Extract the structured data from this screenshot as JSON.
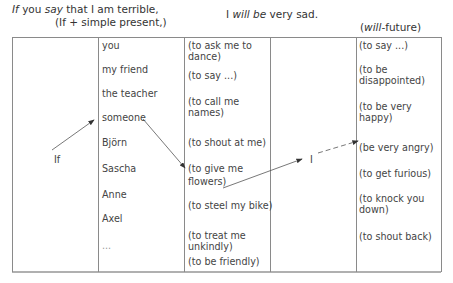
{
  "header": {
    "left_line1_if": "If",
    "left_line1_you": " you ",
    "left_line1_say": "say",
    "left_line1_rest": " that I am terrible,",
    "left_line2": "(If + simple present,)",
    "right_line1_i": "I ",
    "right_line1_will_be": "will be",
    "right_line1_rest": " very sad.",
    "right_line2_will": "will",
    "right_line2_rest": "-future)",
    "right_line2_open": "("
  },
  "table": {
    "col1_label": "If",
    "subjects": [
      "you",
      "my friend",
      "the teacher",
      "someone",
      "Björn",
      "Sascha",
      "Anne",
      "Axel",
      "..."
    ],
    "if_clauses": [
      "(to ask me to",
      "dance)",
      "(to say ...)",
      "(to call me",
      "names)",
      "(to shout at me)",
      "(to give me",
      "flowers)",
      "(to steel my bike)",
      "(to treat me",
      "unkindly)",
      "(to be friendly)"
    ],
    "col4_label": "I",
    "will_clauses": [
      "(to say ...)",
      "(to be",
      "disappointed)",
      "(to be very",
      "happy)",
      "(be very angry)",
      "(to get furious)",
      "(to knock you",
      "down)",
      "(to shout back)"
    ]
  },
  "colors": {
    "border": "#8a8a8a",
    "text": "#444444",
    "arrow": "#333333"
  }
}
